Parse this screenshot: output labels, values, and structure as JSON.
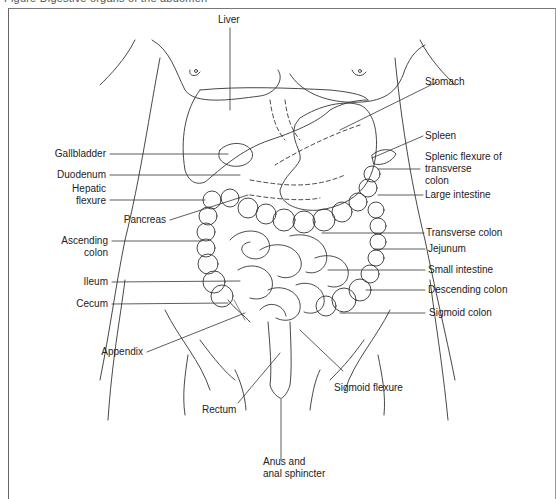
{
  "figure": {
    "caption_partial": "Figure   Digestive organs of the abdomen"
  },
  "labels_left": {
    "gallbladder": "Gallbladder",
    "duodenum": "Duodenum",
    "hepatic_flexure_1": "Hepatic",
    "hepatic_flexure_2": "flexure",
    "pancreas": "Pancreas",
    "ascending_colon_1": "Ascending",
    "ascending_colon_2": "colon",
    "ileum": "Ileum",
    "cecum": "Cecum",
    "appendix": "Appendix"
  },
  "labels_right": {
    "stomach": "Stomach",
    "spleen": "Spleen",
    "splenic_flexure_1": "Splenic flexure of",
    "splenic_flexure_2": "transverse",
    "splenic_flexure_3": "colon",
    "large_intestine": "Large intestine",
    "transverse_colon": "Transverse colon",
    "jejunum": "Jejunum",
    "small_intestine": "Small intestine",
    "descending_colon": "Descending colon",
    "sigmoid_colon": "Sigmoid colon"
  },
  "labels_top": {
    "liver": "Liver"
  },
  "labels_bottom": {
    "rectum": "Rectum",
    "sigmoid_flexure": "Sigmoid flexure",
    "anus_1": "Anus and",
    "anus_2": "anal sphincter"
  },
  "colors": {
    "line": "#333333",
    "background": "#ffffff",
    "frame": "#777777"
  }
}
